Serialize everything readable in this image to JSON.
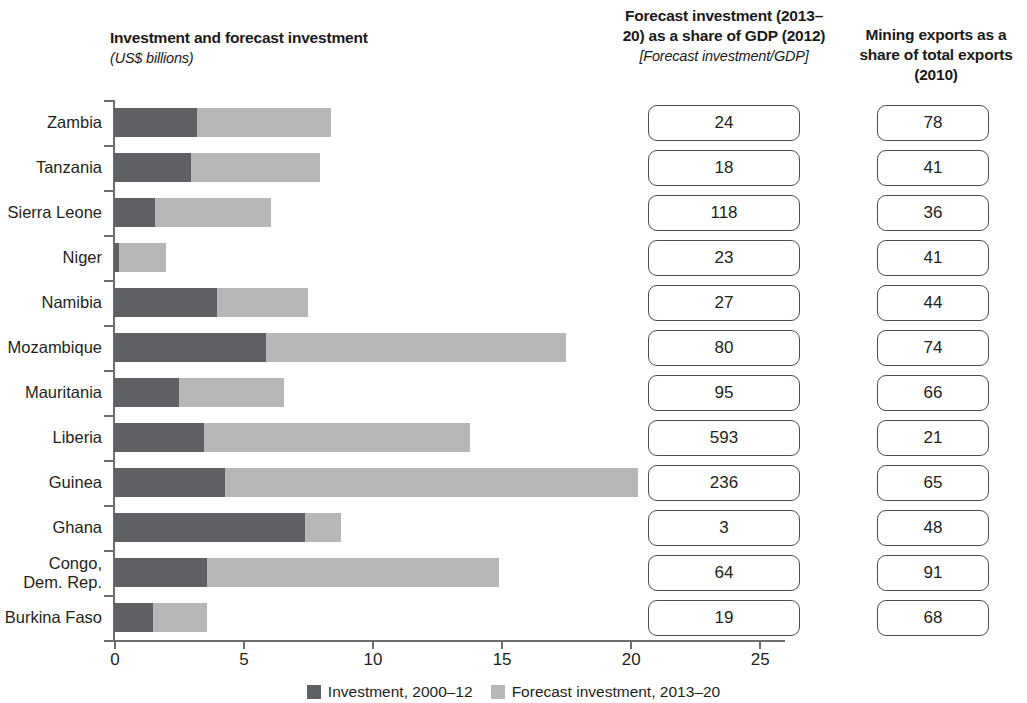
{
  "headers": {
    "chart_title": "Investment and forecast investment",
    "chart_units": "(US$ billions)",
    "gdp_title": "Forecast investment (2013–20) as a share of GDP (2012)",
    "gdp_subtitle": "[Forecast investment/GDP]",
    "mining_title": "Mining exports as a share of total exports (2010)"
  },
  "legend": {
    "items": [
      {
        "label": "Investment, 2000–12",
        "color": "#5f6063"
      },
      {
        "label": "Forecast investment, 2013–20",
        "color": "#b6b7b9"
      }
    ]
  },
  "chart_data": {
    "type": "bar",
    "title": "Investment and forecast investment",
    "xlabel": "",
    "ylabel": "",
    "units": "US$ billions",
    "orientation": "horizontal",
    "stacked": true,
    "grid": false,
    "legend_position": "bottom",
    "xlim": [
      0,
      26
    ],
    "xticks": [
      0,
      5,
      10,
      15,
      20,
      25
    ],
    "xtick_labels": [
      "0",
      "5",
      "10",
      "15",
      "20",
      "25"
    ],
    "categories": [
      "Zambia",
      "Tanzania",
      "Sierra Leone",
      "Niger",
      "Namibia",
      "Mozambique",
      "Mauritania",
      "Liberia",
      "Guinea",
      "Ghana",
      "Congo,\nDem. Rep.",
      "Burkina Faso"
    ],
    "series": [
      {
        "name": "Investment, 2000–12",
        "color": "#5f6063",
        "values": [
          3.2,
          3.0,
          1.6,
          0.2,
          4.0,
          5.9,
          2.5,
          3.5,
          4.3,
          7.4,
          3.6,
          1.5
        ]
      },
      {
        "name": "Forecast investment, 2013–20",
        "color": "#b6b7b9",
        "values": [
          5.2,
          5.0,
          4.5,
          1.8,
          3.5,
          11.6,
          4.1,
          10.3,
          16.0,
          1.4,
          11.3,
          2.1
        ]
      }
    ],
    "totals": [
      8.4,
      8.0,
      6.1,
      2.0,
      7.5,
      17.5,
      6.6,
      13.8,
      20.3,
      8.8,
      14.9,
      3.6
    ],
    "columns": [
      {
        "name": "Forecast investment (2013–20) as a share of GDP (2012)",
        "values": [
          "24",
          "18",
          "118",
          "23",
          "27",
          "80",
          "95",
          "593",
          "236",
          "3",
          "64",
          "19"
        ]
      },
      {
        "name": "Mining exports as a share of total exports (2010)",
        "values": [
          "78",
          "41",
          "36",
          "41",
          "44",
          "74",
          "66",
          "21",
          "65",
          "48",
          "91",
          "68"
        ]
      }
    ]
  }
}
